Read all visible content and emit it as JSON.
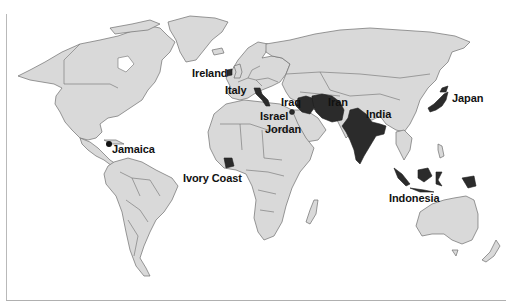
{
  "map": {
    "title": "",
    "land_color": "#d9d9d9",
    "border_color": "#6f6f6f",
    "highlight_color": "#2b2b2b",
    "background_color": "#ffffff",
    "labels": [
      {
        "id": "ireland",
        "text": "Ireland"
      },
      {
        "id": "italy",
        "text": "Italy"
      },
      {
        "id": "iraq",
        "text": "Iraq"
      },
      {
        "id": "iran",
        "text": "Iran"
      },
      {
        "id": "israel",
        "text": "Israel"
      },
      {
        "id": "jordan",
        "text": "Jordan"
      },
      {
        "id": "india",
        "text": "India"
      },
      {
        "id": "japan",
        "text": "Japan"
      },
      {
        "id": "jamaica",
        "text": "Jamaica"
      },
      {
        "id": "ivory_coast",
        "text": "Ivory Coast"
      },
      {
        "id": "indonesia",
        "text": "Indonesia"
      }
    ],
    "highlighted_countries": [
      "Ireland",
      "Italy",
      "Iraq",
      "Iran",
      "Israel",
      "Jordan",
      "India",
      "Japan",
      "Jamaica",
      "Ivory Coast",
      "Indonesia"
    ]
  }
}
